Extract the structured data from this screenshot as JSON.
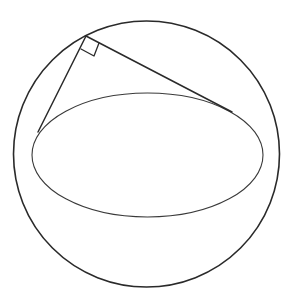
{
  "diagram": {
    "type": "geometry",
    "colors": {
      "background": "#ffffff",
      "stroke": "#2a2a2a",
      "ellipse_stroke": "#3a3a3a"
    },
    "outer_circle": {
      "cx": 146.5,
      "cy": 154,
      "r": 133
    },
    "ellipse": {
      "cx": 147.5,
      "cy": 155,
      "rx": 115.5,
      "ry": 62
    },
    "apex": {
      "x": 86,
      "y": 36
    },
    "left_tangent_point": {
      "x": 38,
      "y": 132
    },
    "right_tangent_point": {
      "x": 232,
      "y": 112
    },
    "right_angle_marker": {
      "points": [
        [
          86,
          36
        ],
        [
          99,
          43
        ],
        [
          94,
          56
        ],
        [
          81,
          49
        ]
      ]
    },
    "labels": []
  }
}
